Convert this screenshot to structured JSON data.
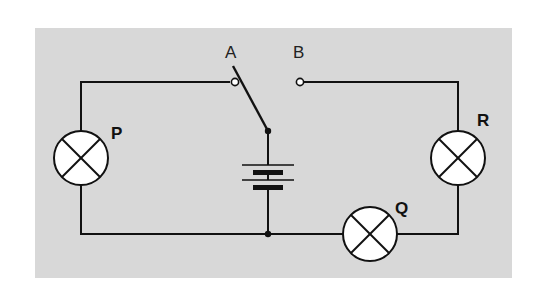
{
  "diagram": {
    "type": "electric-circuit",
    "colors": {
      "panel": "#d8d8d8",
      "wire": "#111111",
      "bulb_fill": "#ffffff",
      "page": "#ffffff"
    },
    "switch": {
      "terminals": [
        {
          "label": "A"
        },
        {
          "label": "B"
        }
      ],
      "state": "connected to A"
    },
    "battery": {
      "cells": 2
    },
    "bulbs": [
      {
        "label": "P"
      },
      {
        "label": "Q"
      },
      {
        "label": "R"
      }
    ]
  }
}
